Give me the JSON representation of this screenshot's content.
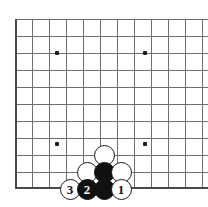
{
  "figure": {
    "kind": "go-board-diagram",
    "title": "",
    "board_background": "#ffffff",
    "grid_color": "#6e6e6e",
    "edge_color": "#4a4a4a",
    "star_color": "#1d1d1d",
    "black_stone_color": "#111111",
    "white_stone_color": "#ffffff"
  },
  "board": {
    "origin_x": 15,
    "origin_y": 19,
    "spacing": 17,
    "cols": 12,
    "rows": 10,
    "left_edge": true,
    "top_edge": false,
    "right_edge": false,
    "bottom_edge": true,
    "bottom_y": 187
  },
  "star_points": [
    {
      "name": "star-upper-left",
      "x": 57,
      "y": 53
    },
    {
      "name": "star-upper-right",
      "x": 145,
      "y": 53
    },
    {
      "name": "star-lower-left",
      "x": 57,
      "y": 144
    },
    {
      "name": "star-lower-right",
      "x": 145,
      "y": 144
    }
  ],
  "stones": [
    {
      "name": "stone-white-unnumbered-top",
      "color": "white",
      "label": "",
      "x": 104,
      "y": 155
    },
    {
      "name": "stone-white-unnumbered-left",
      "color": "white",
      "label": "",
      "x": 87,
      "y": 172
    },
    {
      "name": "stone-black-unnumbered-center",
      "color": "black",
      "label": "",
      "x": 104,
      "y": 172
    },
    {
      "name": "stone-white-unnumbered-right",
      "color": "white",
      "label": "",
      "x": 121,
      "y": 172
    },
    {
      "name": "stone-white-move-3",
      "color": "white",
      "label": "3",
      "x": 70,
      "y": 189
    },
    {
      "name": "stone-black-move-2",
      "color": "black",
      "label": "2",
      "x": 87,
      "y": 189
    },
    {
      "name": "stone-black-unnumbered-bottom",
      "color": "black",
      "label": "",
      "x": 104,
      "y": 189
    },
    {
      "name": "stone-white-move-1",
      "color": "white",
      "label": "1",
      "x": 121,
      "y": 189
    }
  ]
}
